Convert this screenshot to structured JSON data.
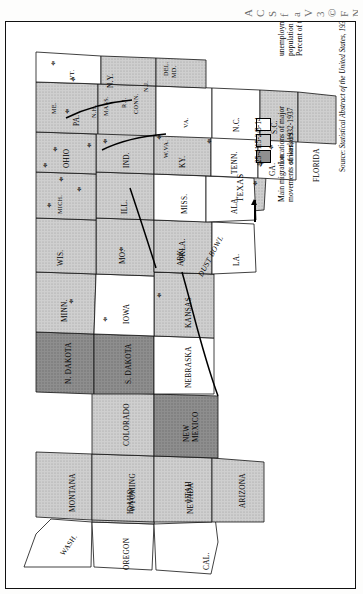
{
  "page": {
    "bleed_glyphs": [
      "A",
      "C",
      "S",
      "f",
      "a",
      "V",
      "3",
      "©",
      "F",
      "N"
    ],
    "orientation": "rotated-90-ccw",
    "background": "#ffffff"
  },
  "legend": {
    "title_line1": "Percent of total",
    "title_line2": "population receiving",
    "title_line3": "unemployment relief, 1934",
    "classes": [
      {
        "label": "25-41",
        "color": "#8f8f8f",
        "key": "high"
      },
      {
        "label": "15-24",
        "color": "#c8c8c8",
        "key": "mid"
      },
      {
        "label": "8-14",
        "color": "#ffffff",
        "key": "low"
      }
    ],
    "strike_line1": "Locations of major",
    "strike_line2": "strikes, 1932-1937",
    "strike_symbol": "⚘",
    "migration_line1": "Main migration",
    "migration_line2": "movements of workers"
  },
  "source": {
    "prefix": "Source:",
    "text": "Statistical Abstract of the United States, 1935"
  },
  "map": {
    "title": "Percent of total population receiving unemployment relief, 1934",
    "dust_bowl_label": "DUST BOWL",
    "states": [
      {
        "name": "WASH.",
        "class": "low"
      },
      {
        "name": "OREGON",
        "class": "low"
      },
      {
        "name": "IDAHO",
        "class": "mid"
      },
      {
        "name": "MONTANA",
        "class": "mid"
      },
      {
        "name": "WYOMING",
        "class": "mid"
      },
      {
        "name": "NEVADA",
        "class": "low"
      },
      {
        "name": "UTAH",
        "class": "mid"
      },
      {
        "name": "CAL.",
        "class": "low"
      },
      {
        "name": "ARIZONA",
        "class": "mid"
      },
      {
        "name": "COLORADO",
        "class": "mid"
      },
      {
        "name": "NEW MEXICO",
        "class": "high"
      },
      {
        "name": "N. DAKOTA",
        "class": "high"
      },
      {
        "name": "S. DAKOTA",
        "class": "high"
      },
      {
        "name": "NEBRASKA",
        "class": "low"
      },
      {
        "name": "KANSAS",
        "class": "mid"
      },
      {
        "name": "OKLA.",
        "class": "high"
      },
      {
        "name": "TEXAS",
        "class": "mid"
      },
      {
        "name": "MINN.",
        "class": "mid"
      },
      {
        "name": "IOWA",
        "class": "low"
      },
      {
        "name": "MO.",
        "class": "mid"
      },
      {
        "name": "ARK.",
        "class": "mid"
      },
      {
        "name": "LA.",
        "class": "low"
      },
      {
        "name": "WIS.",
        "class": "mid"
      },
      {
        "name": "ILL.",
        "class": "mid"
      },
      {
        "name": "MICH.",
        "class": "mid"
      },
      {
        "name": "IND.",
        "class": "mid"
      },
      {
        "name": "OHIO",
        "class": "mid"
      },
      {
        "name": "KY.",
        "class": "mid"
      },
      {
        "name": "TENN.",
        "class": "low"
      },
      {
        "name": "MISS.",
        "class": "low"
      },
      {
        "name": "ALA.",
        "class": "low"
      },
      {
        "name": "GA.",
        "class": "low"
      },
      {
        "name": "FLORIDA",
        "class": "mid"
      },
      {
        "name": "S.C.",
        "class": "mid"
      },
      {
        "name": "N.C.",
        "class": "low"
      },
      {
        "name": "VA.",
        "class": "low"
      },
      {
        "name": "W.VA.",
        "class": "mid"
      },
      {
        "name": "PA.",
        "class": "mid"
      },
      {
        "name": "N.Y.",
        "class": "mid"
      },
      {
        "name": "ME.",
        "class": "low"
      },
      {
        "name": "VT.",
        "class": "low"
      },
      {
        "name": "N.H.",
        "class": "low"
      },
      {
        "name": "MASS.",
        "class": "mid"
      },
      {
        "name": "R.I.",
        "class": "mid"
      },
      {
        "name": "CONN.",
        "class": "mid"
      },
      {
        "name": "N.J.",
        "class": "mid"
      },
      {
        "name": "DEL.",
        "class": "mid"
      },
      {
        "name": "MD.",
        "class": "mid"
      }
    ],
    "strike_marker_count": 18,
    "migration_arrow_count": 4
  }
}
